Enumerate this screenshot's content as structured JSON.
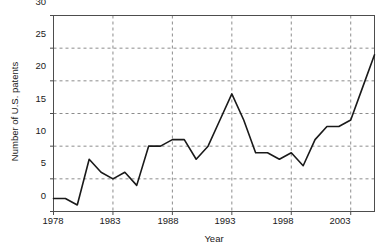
{
  "chart_data": {
    "type": "line",
    "title": "",
    "xlabel": "Year",
    "ylabel": "Number of U.S. patents",
    "xlim": [
      1978,
      2005
    ],
    "ylim": [
      0,
      30
    ],
    "xticks": [
      1978,
      1983,
      1988,
      1993,
      1998,
      2003
    ],
    "yticks": [
      0,
      5,
      10,
      15,
      20,
      25,
      30
    ],
    "xtick_labels": [
      "1978",
      "1983",
      "1988",
      "1993",
      "1998",
      "2003"
    ],
    "ytick_labels": [
      "0",
      "5",
      "10",
      "15",
      "20",
      "25",
      "30"
    ],
    "grid": true,
    "grid_style": "dashed",
    "legend": null,
    "line_color": "#1a1a1a",
    "grid_color": "#8c8c8c",
    "axis_color": "#4d4d4d",
    "background": "#ffffff",
    "x": [
      1978,
      1979,
      1980,
      1981,
      1982,
      1983,
      1984,
      1985,
      1986,
      1987,
      1988,
      1989,
      1990,
      1991,
      1992,
      1993,
      1994,
      1995,
      1996,
      1997,
      1998,
      1999,
      2000,
      2001,
      2002,
      2003,
      2004,
      2005
    ],
    "values": [
      2,
      2,
      1,
      8,
      6,
      5,
      6,
      4,
      10,
      10,
      11,
      11,
      8,
      10,
      14,
      18,
      14,
      9,
      9,
      8,
      9,
      7,
      11,
      13,
      13,
      14,
      19,
      24
    ],
    "series": [
      {
        "name": "U.S. patents",
        "values": [
          2,
          2,
          1,
          8,
          6,
          5,
          6,
          4,
          10,
          10,
          11,
          11,
          8,
          10,
          14,
          18,
          14,
          9,
          9,
          8,
          9,
          7,
          11,
          13,
          13,
          14,
          19,
          24
        ]
      }
    ]
  },
  "axis": {
    "y_title": "Number of U.S. patents",
    "x_title": "Year"
  }
}
